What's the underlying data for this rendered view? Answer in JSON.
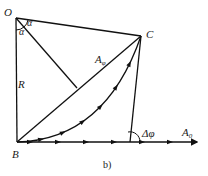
{
  "figure": {
    "caption": "b)",
    "points": {
      "O": "O",
      "B": "B",
      "C": "C"
    },
    "labels": {
      "radius": "R",
      "angle_top": "α",
      "angle_left": "α",
      "chord_main": "A",
      "chord_main_sub": "φ",
      "phase_angle": "Δφ",
      "baseline_main": "A",
      "baseline_sub": "0"
    },
    "curve_arrow_count": 6,
    "baseline_arrow_count": 6
  }
}
